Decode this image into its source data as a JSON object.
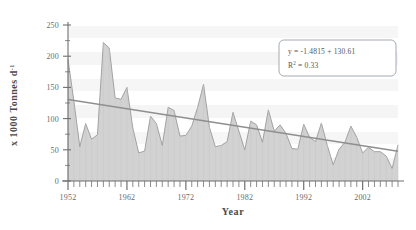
{
  "chart_data": {
    "type": "area",
    "title": "",
    "xlabel": "Year",
    "ylabel": "x 1000 Tonnes d",
    "ylabel_exponent": "-1",
    "xlim": [
      1952,
      2008
    ],
    "ylim": [
      0,
      250
    ],
    "y_ticks": [
      0,
      50,
      100,
      150,
      200,
      250
    ],
    "x_ticks": [
      1952,
      1962,
      1972,
      1982,
      1992,
      2002
    ],
    "x_tick_interval_minor": 1,
    "grid": false,
    "legend": "none",
    "series": [
      {
        "name": "Landings",
        "type": "area",
        "fill_color": "#d2d2d2",
        "line_color": "#9a9a9a",
        "x": [
          1952,
          1953,
          1954,
          1955,
          1956,
          1957,
          1958,
          1959,
          1960,
          1961,
          1962,
          1963,
          1964,
          1965,
          1966,
          1967,
          1968,
          1969,
          1970,
          1971,
          1972,
          1973,
          1974,
          1975,
          1976,
          1977,
          1978,
          1979,
          1980,
          1981,
          1982,
          1983,
          1984,
          1985,
          1986,
          1987,
          1988,
          1989,
          1990,
          1991,
          1992,
          1993,
          1994,
          1995,
          1996,
          1997,
          1998,
          1999,
          2000,
          2001,
          2002,
          2003,
          2004,
          2005,
          2006,
          2007,
          2008
        ],
        "values": [
          195,
          128,
          55,
          92,
          67,
          74,
          222,
          213,
          133,
          131,
          150,
          85,
          45,
          48,
          104,
          92,
          57,
          118,
          113,
          72,
          73,
          88,
          118,
          155,
          86,
          55,
          57,
          63,
          110,
          80,
          50,
          96,
          90,
          62,
          114,
          80,
          90,
          76,
          52,
          51,
          91,
          70,
          63,
          93,
          57,
          26,
          51,
          62,
          88,
          70,
          45,
          54,
          47,
          47,
          40,
          20,
          58
        ]
      },
      {
        "name": "Linear trend",
        "type": "line",
        "line_color": "#8f8f8f",
        "x": [
          1952,
          2008
        ],
        "values": [
          130.61,
          47.6
        ]
      }
    ],
    "annotations": [
      {
        "name": "regression-equation",
        "line1": "y = -1.4815 + 130.61",
        "line2_base": "R",
        "line2_sup": "2",
        "line2_rest": " = 0.33",
        "box": true
      }
    ]
  },
  "axis": {
    "y_tick_labels": [
      "250",
      "200",
      "150",
      "100",
      "50",
      "0"
    ],
    "x_tick_labels": [
      "1952",
      "1962",
      "1972",
      "1982",
      "1992",
      "2002"
    ],
    "y_title_main": "x 1000 Tonnes d",
    "y_title_sup": "-1",
    "x_title": "Year"
  },
  "colors": {
    "area_fill": "#d2d2d2",
    "area_stroke": "#9b9b9b",
    "trend_line": "#8f8f8f",
    "axis": "#6f6f6f",
    "text": "#4a4a4a",
    "band": "#f4f4f4",
    "box_border": "#9aa0a8"
  }
}
